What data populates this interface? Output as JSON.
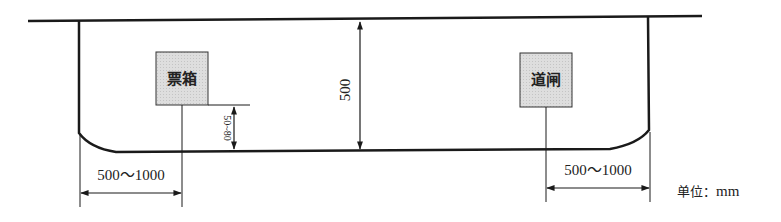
{
  "diagram": {
    "type": "plan-dimension-drawing",
    "elements": {
      "ticket_box": {
        "label": "票箱"
      },
      "gate": {
        "label": "道闸"
      }
    },
    "dimensions": {
      "lane_width": "500",
      "ticket_box_offset": "50~80",
      "left_setback": "500～1000",
      "right_setback": "500～1000"
    },
    "unit": {
      "label": "单位：",
      "value": "mm"
    },
    "colors": {
      "line": "#1a1a1a",
      "box_fill": "#dcdcdc",
      "box_stroke": "#333333"
    }
  }
}
